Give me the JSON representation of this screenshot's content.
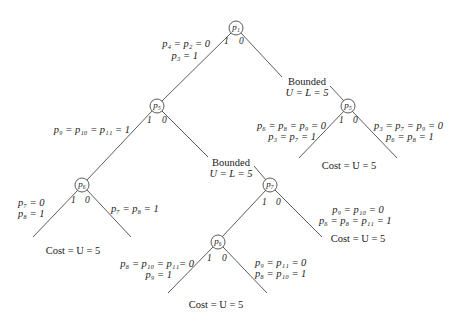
{
  "diagram": {
    "type": "branch-and-bound-tree",
    "nodes": [
      {
        "id": "n1",
        "label": "p1",
        "x": 236,
        "y": 28
      },
      {
        "id": "n2",
        "label": "p5",
        "x": 157,
        "y": 106
      },
      {
        "id": "n3",
        "label": "p5",
        "x": 348,
        "y": 106
      },
      {
        "id": "n4",
        "label": "p6",
        "x": 82,
        "y": 185
      },
      {
        "id": "n5",
        "label": "p7",
        "x": 270,
        "y": 185
      },
      {
        "id": "n6",
        "label": "p6",
        "x": 218,
        "y": 242
      }
    ],
    "node_text": {
      "n1": "p₁",
      "n2": "p₅",
      "n3": "p₅",
      "n4": "p₆",
      "n5": "p₇",
      "n6": "p₆"
    },
    "branch_labels": {
      "n1_one": "1",
      "n1_zero": "0",
      "n2_one": "1",
      "n2_zero": "0",
      "n3_one": "1",
      "n3_zero": "0",
      "n4_one": "1",
      "n4_zero": "0",
      "n5_one": "1",
      "n5_zero": "0",
      "n6_one": "1",
      "n6_zero": "0"
    },
    "annotations": {
      "root_left_line1": "p₄ = p₂ = 0",
      "root_left_line2": "p₃ = 1",
      "bounded_right_title": "Bounded",
      "bounded_right_value": "U = L = 5",
      "p5r_left_line1": "p₆ = p₈ = p₉ = 0",
      "p5r_left_line2": "p₃ = p₇ = 1",
      "p5r_right_line1": "p₃ = p₇ = p₉ = 0",
      "p5r_right_line2": "p₆ = p₈ = 1",
      "p5r_cost": "Cost = U = 5",
      "p5l_left": "p₉ = p₁₀ = p₁₁ = 1",
      "bounded_mid_title": "Bounded",
      "bounded_mid_value": "U = L = 5",
      "p6l_left_line1": "p₇ = 0",
      "p6l_left_line2": "p₈ = 1",
      "p6l_right": "p₇ = p₈ = 1",
      "p6l_cost": "Cost = U = 5",
      "p7_right_line1": "p₉ = p₁₀ = 0",
      "p7_right_line2": "p₆ = p₈ = p₁₁ = 1",
      "p7_cost": "Cost = U = 5",
      "p6b_left_line1": "p₈ = p₁₀ = p₁₁= 0",
      "p6b_left_line2": "p₉ = 1",
      "p6b_right_line1": "p₉ = p₁₁ = 0",
      "p6b_right_line2": "p₈ = p₁₀ = 1",
      "p6b_cost": "Cost = U = 5"
    },
    "colors": {
      "line": "#4a4a4a",
      "text": "#1a1a1a",
      "background": "#ffffff"
    }
  }
}
